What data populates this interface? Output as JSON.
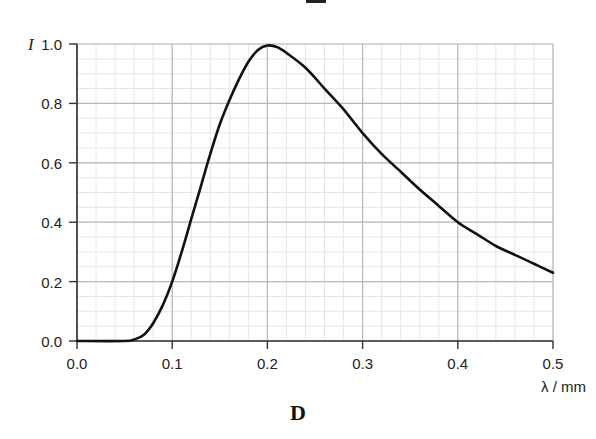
{
  "caption": "D",
  "chart_data": {
    "type": "line",
    "title": "",
    "xlabel": "λ / mm",
    "ylabel": "I",
    "xlim": [
      0.0,
      0.5
    ],
    "ylim": [
      0.0,
      1.0
    ],
    "grid": true,
    "minor_grid": true,
    "legend": null,
    "x_ticks": [
      "0.0",
      "0.1",
      "0.2",
      "0.3",
      "0.4",
      "0.5"
    ],
    "y_ticks": [
      "0.0",
      "0.2",
      "0.4",
      "0.6",
      "0.8",
      "1.0"
    ],
    "series": [
      {
        "name": "I(λ)",
        "color": "#111111",
        "x": [
          0.0,
          0.05,
          0.06,
          0.07,
          0.08,
          0.09,
          0.1,
          0.11,
          0.12,
          0.13,
          0.14,
          0.15,
          0.16,
          0.17,
          0.18,
          0.19,
          0.2,
          0.21,
          0.22,
          0.24,
          0.26,
          0.28,
          0.3,
          0.32,
          0.34,
          0.36,
          0.38,
          0.4,
          0.42,
          0.44,
          0.46,
          0.48,
          0.5
        ],
        "y": [
          0.0,
          0.0,
          0.005,
          0.02,
          0.06,
          0.12,
          0.2,
          0.3,
          0.41,
          0.52,
          0.63,
          0.73,
          0.81,
          0.88,
          0.94,
          0.98,
          0.995,
          0.99,
          0.97,
          0.92,
          0.85,
          0.78,
          0.7,
          0.63,
          0.57,
          0.51,
          0.455,
          0.4,
          0.36,
          0.32,
          0.29,
          0.26,
          0.23
        ]
      }
    ]
  },
  "colors": {
    "major_grid": "#b8b8b8",
    "minor_grid": "#e6e6e6",
    "axis": "#333333",
    "curve": "#111111",
    "text": "#222222"
  }
}
